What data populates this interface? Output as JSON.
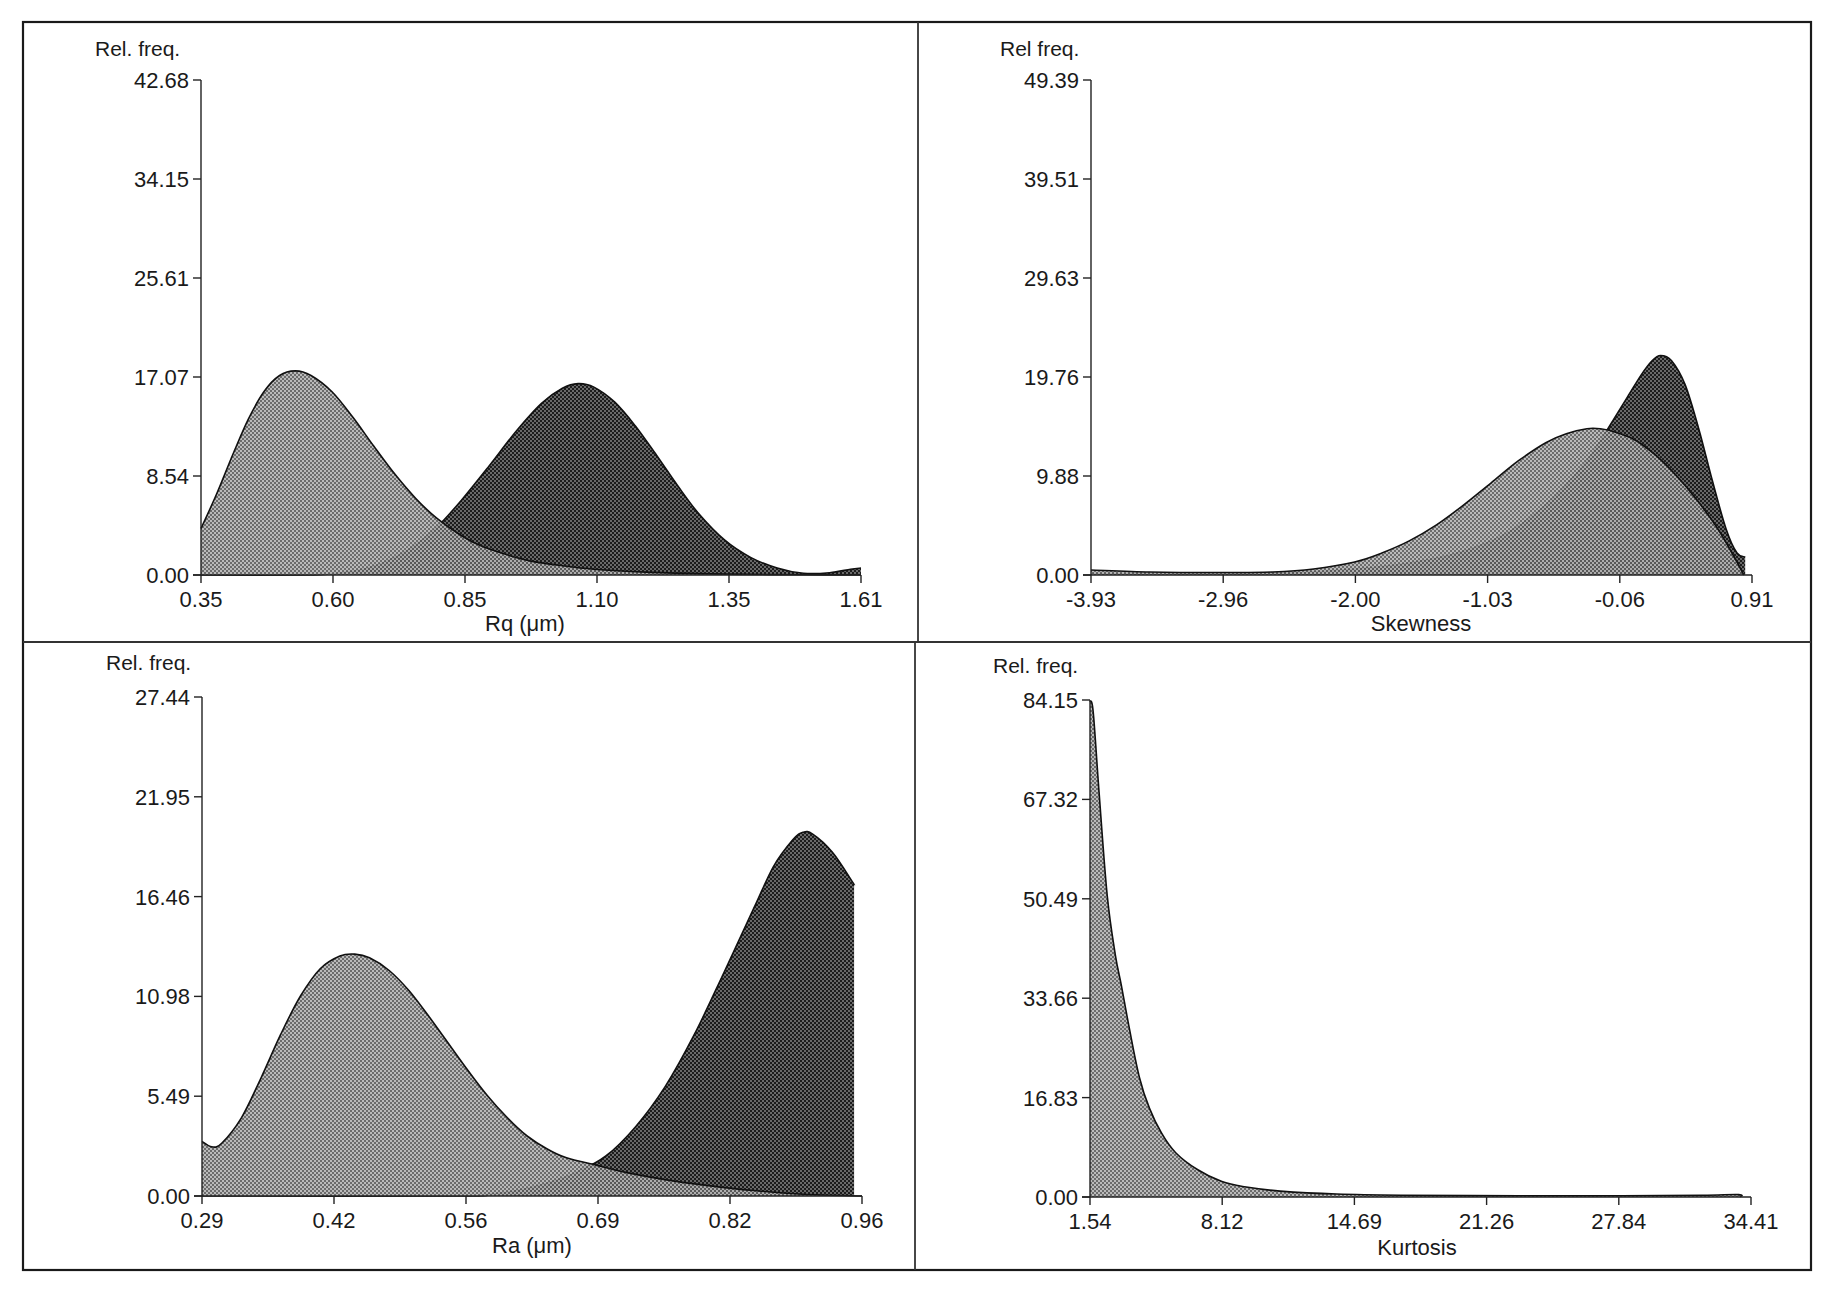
{
  "figure": {
    "panels": [
      {
        "id": "rq",
        "y_label": "Rel. freq.",
        "x_label": "Rq (μm)",
        "y_ticks": [
          "0.00",
          "8.54",
          "17.07",
          "25.61",
          "34.15",
          "42.68"
        ],
        "x_ticks": [
          "0.35",
          "0.60",
          "0.85",
          "1.10",
          "1.35",
          "1.61"
        ]
      },
      {
        "id": "skewness",
        "y_label": "Rel freq.",
        "x_label": "Skewness",
        "y_ticks": [
          "0.00",
          "9.88",
          "19.76",
          "29.63",
          "39.51",
          "49.39"
        ],
        "x_ticks": [
          "-3.93",
          "-2.96",
          "-2.00",
          "-1.03",
          "-0.06",
          "0.91"
        ]
      },
      {
        "id": "ra",
        "y_label": "Rel. freq.",
        "x_label": "Ra (μm)",
        "y_ticks": [
          "0.00",
          "5.49",
          "10.98",
          "16.46",
          "21.95",
          "27.44"
        ],
        "x_ticks": [
          "0.29",
          "0.42",
          "0.56",
          "0.69",
          "0.82",
          "0.96"
        ]
      },
      {
        "id": "kurtosis",
        "y_label": "Rel. freq.",
        "x_label": "Kurtosis",
        "y_ticks": [
          "0.00",
          "16.83",
          "33.66",
          "50.49",
          "67.32",
          "84.15"
        ],
        "x_ticks": [
          "1.54",
          "8.12",
          "14.69",
          "21.26",
          "27.84",
          "34.41"
        ]
      }
    ],
    "colors": {
      "light_fill": "#8e8e8e",
      "dark_fill": "#3a3a3a",
      "line": "#111111",
      "frame": "#1a1a1a"
    }
  },
  "chart_data": [
    {
      "type": "area",
      "title": "",
      "xlabel": "Rq (μm)",
      "ylabel": "Rel. freq.",
      "xlim": [
        0.35,
        1.61
      ],
      "ylim": [
        0.0,
        42.68
      ],
      "grid": false,
      "legend": "none",
      "series": [
        {
          "name": "light distribution",
          "fill": "light",
          "x": [
            0.35,
            0.38,
            0.41,
            0.44,
            0.47,
            0.5,
            0.53,
            0.56,
            0.6,
            0.64,
            0.68,
            0.72,
            0.76,
            0.8,
            0.84,
            0.88,
            0.93,
            0.98,
            1.04,
            1.1,
            1.2,
            1.3,
            1.4,
            1.5,
            1.61
          ],
          "y": [
            4.0,
            7.0,
            10.3,
            13.4,
            15.8,
            17.2,
            17.6,
            17.2,
            15.8,
            13.6,
            11.1,
            8.7,
            6.6,
            4.9,
            3.6,
            2.6,
            1.8,
            1.2,
            0.8,
            0.5,
            0.25,
            0.12,
            0.05,
            0.02,
            0.0
          ]
        },
        {
          "name": "dark distribution",
          "fill": "dark",
          "x": [
            0.35,
            0.55,
            0.6,
            0.65,
            0.7,
            0.75,
            0.8,
            0.85,
            0.9,
            0.95,
            1.0,
            1.04,
            1.07,
            1.1,
            1.14,
            1.18,
            1.22,
            1.26,
            1.3,
            1.35,
            1.4,
            1.45,
            1.5,
            1.55,
            1.59,
            1.61
          ],
          "y": [
            0.0,
            0.0,
            0.1,
            0.4,
            1.1,
            2.3,
            4.1,
            6.6,
            9.4,
            12.3,
            14.8,
            16.1,
            16.5,
            16.2,
            14.9,
            12.8,
            10.3,
            7.7,
            5.3,
            3.0,
            1.5,
            0.6,
            0.15,
            0.2,
            0.5,
            0.6
          ]
        }
      ]
    },
    {
      "type": "area",
      "title": "",
      "xlabel": "Skewness",
      "ylabel": "Rel freq.",
      "xlim": [
        -3.93,
        0.91
      ],
      "ylim": [
        0.0,
        49.39
      ],
      "grid": false,
      "legend": "none",
      "series": [
        {
          "name": "light distribution",
          "fill": "light",
          "x": [
            -3.93,
            -3.5,
            -3.0,
            -2.6,
            -2.3,
            -2.0,
            -1.8,
            -1.6,
            -1.4,
            -1.2,
            -1.0,
            -0.8,
            -0.6,
            -0.45,
            -0.3,
            -0.2,
            -0.1,
            0.05,
            0.2,
            0.35,
            0.5,
            0.65,
            0.78,
            0.85
          ],
          "y": [
            0.5,
            0.3,
            0.25,
            0.3,
            0.6,
            1.3,
            2.2,
            3.4,
            5.0,
            7.0,
            9.2,
            11.4,
            13.2,
            14.1,
            14.6,
            14.6,
            14.3,
            13.5,
            12.0,
            10.0,
            7.6,
            4.8,
            1.8,
            0.0
          ]
        },
        {
          "name": "dark distribution",
          "fill": "dark",
          "x": [
            -3.93,
            -3.0,
            -2.5,
            -2.0,
            -1.6,
            -1.3,
            -1.0,
            -0.8,
            -0.6,
            -0.45,
            -0.3,
            -0.2,
            -0.1,
            0.0,
            0.1,
            0.18,
            0.24,
            0.32,
            0.42,
            0.52,
            0.62,
            0.72,
            0.8,
            0.86
          ],
          "y": [
            0.1,
            0.1,
            0.2,
            0.6,
            1.2,
            2.0,
            3.4,
            4.9,
            7.0,
            9.0,
            11.4,
            13.4,
            15.6,
            17.8,
            20.0,
            21.4,
            21.9,
            21.4,
            19.0,
            14.6,
            9.4,
            4.6,
            2.2,
            1.8
          ]
        }
      ]
    },
    {
      "type": "area",
      "title": "",
      "xlabel": "Ra (μm)",
      "ylabel": "Rel. freq.",
      "xlim": [
        0.29,
        0.96
      ],
      "ylim": [
        0.0,
        27.44
      ],
      "grid": false,
      "legend": "none",
      "series": [
        {
          "name": "light distribution",
          "fill": "light",
          "x": [
            0.29,
            0.3,
            0.31,
            0.33,
            0.35,
            0.37,
            0.39,
            0.41,
            0.43,
            0.445,
            0.46,
            0.48,
            0.5,
            0.52,
            0.54,
            0.56,
            0.58,
            0.6,
            0.62,
            0.64,
            0.66,
            0.69,
            0.72,
            0.76,
            0.8,
            0.85,
            0.9,
            0.96
          ],
          "y": [
            3.0,
            2.7,
            2.9,
            4.3,
            6.5,
            8.9,
            11.0,
            12.5,
            13.2,
            13.3,
            13.1,
            12.4,
            11.3,
            9.9,
            8.4,
            6.9,
            5.5,
            4.3,
            3.3,
            2.6,
            2.1,
            1.7,
            1.3,
            0.9,
            0.6,
            0.3,
            0.1,
            0.0
          ]
        },
        {
          "name": "dark distribution",
          "fill": "dark",
          "x": [
            0.29,
            0.55,
            0.58,
            0.61,
            0.64,
            0.67,
            0.7,
            0.73,
            0.76,
            0.79,
            0.82,
            0.85,
            0.87,
            0.89,
            0.9,
            0.91,
            0.93,
            0.95,
            0.952
          ],
          "y": [
            0.0,
            0.0,
            0.1,
            0.3,
            0.7,
            1.3,
            2.2,
            3.8,
            6.0,
            8.9,
            12.3,
            15.8,
            18.1,
            19.6,
            20.0,
            19.9,
            18.9,
            17.3,
            17.1
          ]
        }
      ]
    },
    {
      "type": "area",
      "title": "",
      "xlabel": "Kurtosis",
      "ylabel": "Rel. freq.",
      "xlim": [
        1.54,
        34.41
      ],
      "ylim": [
        0.0,
        84.15
      ],
      "grid": false,
      "legend": "none",
      "series": [
        {
          "name": "light distribution",
          "fill": "light",
          "x": [
            1.54,
            1.7,
            2.0,
            2.4,
            2.8,
            3.1,
            3.5,
            4.0,
            4.5,
            5.1,
            5.8,
            6.9,
            8.1,
            9.2,
            11.0,
            13.8,
            17.0,
            22.9,
            28.0,
            32.0,
            33.8,
            33.9
          ],
          "y": [
            84.0,
            82.1,
            68.0,
            50.9,
            41.0,
            35.8,
            28.5,
            20.2,
            15.0,
            10.8,
            7.5,
            4.6,
            2.6,
            1.75,
            1.0,
            0.5,
            0.3,
            0.2,
            0.2,
            0.3,
            0.4,
            0.0
          ]
        }
      ]
    }
  ]
}
